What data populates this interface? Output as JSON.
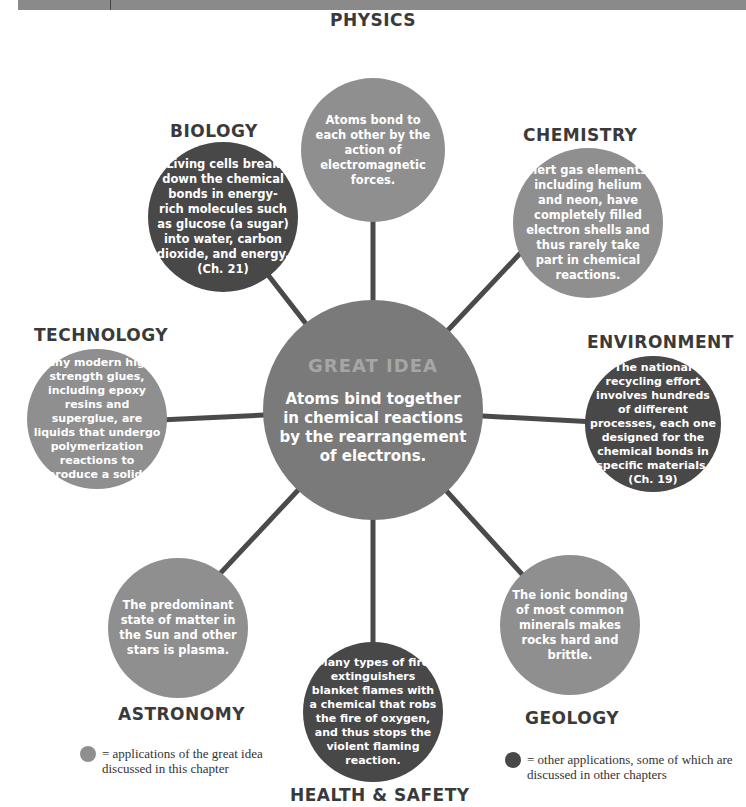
{
  "center": {
    "title": "GREAT IDEA",
    "text": "Atoms bind together in chemical reactions by the rearrangement of electrons."
  },
  "nodes": [
    {
      "id": "physics",
      "label": "PHYSICS",
      "text": "Atoms bond to each other by the action of electromagnetic forces.",
      "type": "light"
    },
    {
      "id": "biology",
      "label": "BIOLOGY",
      "text": "Living cells break down the chemical bonds in energy-rich molecules such as glucose (a sugar) into water, carbon dioxide, and energy. (Ch. 21)",
      "type": "dark"
    },
    {
      "id": "chemistry",
      "label": "CHEMISTRY",
      "text": "Inert gas elements, including helium and neon, have completely filled electron shells and thus rarely take part in chemical reactions.",
      "type": "light"
    },
    {
      "id": "technology",
      "label": "TECHNOLOGY",
      "text": "Many modern high-strength glues, including epoxy resins and superglue, are liquids that undergo polymerization reactions to produce a solid.",
      "type": "light"
    },
    {
      "id": "environment",
      "label": "ENVIRONMENT",
      "text": "The national recycling effort involves hundreds of different processes, each one designed for the chemical bonds in specific materials. (Ch. 19)",
      "type": "dark"
    },
    {
      "id": "astronomy",
      "label": "ASTRONOMY",
      "text": "The predominant state of matter in the Sun and other stars is plasma.",
      "type": "light"
    },
    {
      "id": "health_safety",
      "label": "HEALTH & SAFETY",
      "text": "Many types of fire extinguishers blanket flames with a chemical that robs the fire of oxygen, and thus stops the violent flaming reaction.",
      "type": "dark"
    },
    {
      "id": "geology",
      "label": "GEOLOGY",
      "text": "The ionic bonding of most common minerals makes rocks hard and brittle.",
      "type": "light"
    }
  ],
  "legend": {
    "light": "= applications of the great idea discussed in this chapter",
    "dark": "= other applications, some of which are discussed in other chapters"
  },
  "colors": {
    "light_node": "#8f8f8f",
    "dark_node": "#484848",
    "center_node": "#7a7a7a",
    "connector": "#4a4a4a"
  }
}
